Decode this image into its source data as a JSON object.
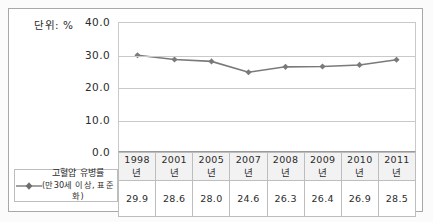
{
  "unit_label": "단위: %",
  "colors": {
    "line": "#7a7a7a",
    "marker": "#6e6e6e",
    "grid": "#c9c9c9",
    "frame": "#a8a8a8",
    "text": "#2b2b2b",
    "header_fill": "#f2f2f2"
  },
  "legend": {
    "name": "series-marker",
    "line1": "고혈압 유병률",
    "line2": "(만30세 이상, 표준화)"
  },
  "axis": {
    "yticks": [
      "40.0",
      "30.0",
      "20.0",
      "10.0",
      "0.0"
    ]
  },
  "chart_data": {
    "type": "line",
    "title": "",
    "subtitle": "",
    "xlabel": "",
    "ylabel": "",
    "unit": "%",
    "categories": [
      "1998년",
      "2001년",
      "2005년",
      "2007년",
      "2008년",
      "2009년",
      "2010년",
      "2011년"
    ],
    "series": [
      {
        "name": "고혈압 유병률 (만30세 이상, 표준화)",
        "values": [
          29.9,
          28.6,
          28.0,
          24.6,
          26.3,
          26.4,
          26.9,
          28.5
        ],
        "value_labels": [
          "29.9",
          "28.6",
          "28.0",
          "24.6",
          "26.3",
          "26.4",
          "26.9",
          "28.5"
        ],
        "marker": "diamond",
        "color": "#7a7a7a"
      }
    ],
    "ylim": [
      0.0,
      40.0
    ],
    "ytick_values": [
      40.0,
      30.0,
      20.0,
      10.0,
      0.0
    ],
    "ytick_labels": [
      "40.0",
      "30.0",
      "20.0",
      "10.0",
      "0.0"
    ],
    "grid": true,
    "grid_axis": "y",
    "legend_position": "bottom-left",
    "data_table_shown": true
  }
}
